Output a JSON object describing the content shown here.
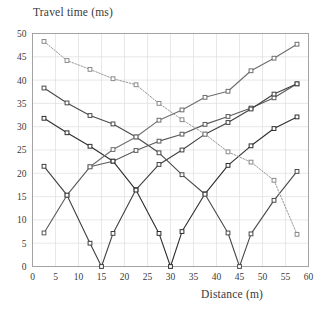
{
  "chart_data": {
    "type": "line",
    "title": "",
    "xlabel": "Distance (m)",
    "ylabel": "Travel time (ms)",
    "xlim": [
      0,
      60
    ],
    "ylim": [
      0,
      50
    ],
    "xticks": [
      0,
      5,
      10,
      15,
      20,
      25,
      30,
      35,
      40,
      45,
      50,
      55,
      60
    ],
    "yticks": [
      0,
      5,
      10,
      15,
      20,
      25,
      30,
      35,
      40,
      45,
      50
    ],
    "grid": true,
    "legend": "none",
    "marker": "square",
    "series": [
      {
        "name": "shot-at-0m-forward",
        "color": "#5a5a5a",
        "style": "solid",
        "x": [
          2.5,
          7.5,
          12.5,
          17.5,
          22.5,
          27.5,
          32.5,
          37.5,
          42.5,
          47.5,
          52.5,
          57.5
        ],
        "y": [
          7.2,
          15.3,
          21.4,
          22.6,
          24.9,
          26.9,
          28.4,
          30.5,
          32.2,
          34.0,
          36.2,
          39.2
        ]
      },
      {
        "name": "shot-at-15m",
        "color": "#404040",
        "style": "solid",
        "x": [
          2.5,
          7.5,
          12.5,
          15.0,
          17.5,
          22.5,
          27.5,
          32.5,
          37.5,
          42.5,
          47.5,
          52.5,
          57.5
        ],
        "y": [
          21.5,
          15.3,
          5.0,
          0.0,
          7.1,
          16.5,
          21.9,
          25.0,
          28.4,
          30.9,
          33.8,
          37.0,
          39.2
        ]
      },
      {
        "name": "shot-at-30m",
        "color": "#2e2e2e",
        "style": "solid",
        "x": [
          2.5,
          7.5,
          12.5,
          17.5,
          22.5,
          27.5,
          30.0,
          32.5,
          37.5,
          42.5,
          47.5,
          52.5,
          57.5
        ],
        "y": [
          31.8,
          28.7,
          25.8,
          22.6,
          16.4,
          7.1,
          0.0,
          7.5,
          15.6,
          21.7,
          25.9,
          29.6,
          32.1
        ]
      },
      {
        "name": "shot-at-45m",
        "color": "#4a4a4a",
        "style": "solid",
        "x": [
          2.5,
          7.5,
          12.5,
          17.5,
          22.5,
          27.5,
          32.5,
          37.5,
          42.5,
          45.0,
          47.5,
          52.5,
          57.5
        ],
        "y": [
          38.3,
          35.1,
          32.4,
          30.6,
          27.8,
          24.4,
          19.7,
          15.5,
          7.2,
          0.0,
          7.0,
          14.2,
          20.4
        ]
      },
      {
        "name": "shot-at-60m-reverse",
        "color": "#8a8a8a",
        "style": "dotted",
        "x": [
          2.5,
          7.5,
          12.5,
          17.5,
          22.5,
          27.5,
          32.5,
          37.5,
          42.5,
          47.5,
          52.5,
          57.5
        ],
        "y": [
          48.3,
          44.2,
          42.3,
          40.3,
          39.0,
          35.0,
          31.5,
          28.4,
          24.6,
          22.4,
          18.5,
          6.9
        ]
      },
      {
        "name": "reverse-upper-branch",
        "color": "#6e6e6e",
        "style": "solid",
        "x": [
          12.5,
          17.5,
          22.5,
          27.5,
          32.5,
          37.5,
          42.5,
          47.5,
          52.5,
          57.5
        ],
        "y": [
          21.4,
          25.1,
          27.8,
          31.4,
          33.6,
          36.3,
          37.6,
          42.0,
          44.7,
          47.7
        ]
      }
    ]
  },
  "axes": {
    "x_axis_name": "distance-axis",
    "y_axis_name": "travel-time-axis"
  }
}
